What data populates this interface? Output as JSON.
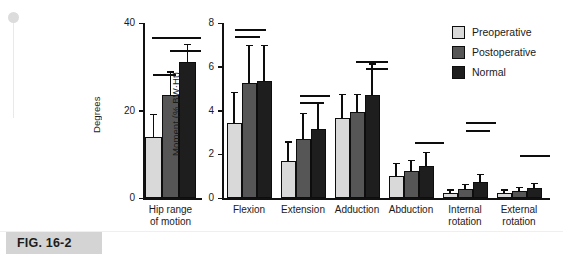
{
  "figure": {
    "caption_tag": "FIG. 16-2"
  },
  "legend": {
    "items": [
      {
        "label": "Preoperative",
        "color": "#d9d9d9"
      },
      {
        "label": "Postoperative",
        "color": "#565656"
      },
      {
        "label": "Normal",
        "color": "#1e1e1e"
      }
    ]
  },
  "chart_data": [
    {
      "type": "bar",
      "title": "",
      "panel": "left",
      "xlabel": "",
      "ylabel": "Degrees",
      "ylim": [
        0,
        40
      ],
      "yticks": [
        0,
        20,
        40
      ],
      "ytick_labels": [
        "0",
        "20",
        "40"
      ],
      "grid": false,
      "categories": [
        "Hip range\nof motion"
      ],
      "series": [
        {
          "name": "Preoperative",
          "values": [
            14.0
          ],
          "errors": [
            5.2
          ]
        },
        {
          "name": "Postoperative",
          "values": [
            23.5
          ],
          "errors": [
            5.5
          ]
        },
        {
          "name": "Normal",
          "values": [
            31.0
          ],
          "errors": [
            4.3
          ]
        }
      ],
      "significance_bars": [
        {
          "note": "Preoperative vs Normal",
          "span": "wide",
          "level": 1
        },
        {
          "note": "Postoperative vs Normal",
          "span": "narrow",
          "level": 2
        },
        {
          "note": "Preoperative vs Postoperative",
          "span": "short",
          "level": 3
        }
      ]
    },
    {
      "type": "bar",
      "title": "",
      "panel": "right",
      "xlabel": "",
      "ylabel": "Moment (% BW·Ht)",
      "ylim": [
        0,
        8
      ],
      "yticks": [
        0,
        2,
        4,
        6,
        8
      ],
      "ytick_labels": [
        "0",
        "2",
        "4",
        "6",
        "8"
      ],
      "grid": false,
      "categories": [
        "Flexion",
        "Extension",
        "Adduction",
        "Abduction",
        "Internal\nrotation",
        "External\nrotation"
      ],
      "series": [
        {
          "name": "Preoperative",
          "values": [
            3.45,
            1.7,
            3.65,
            1.0,
            0.25,
            0.22
          ],
          "errors": [
            1.4,
            0.9,
            1.1,
            0.6,
            0.15,
            0.18
          ]
        },
        {
          "name": "Postoperative",
          "values": [
            5.25,
            2.7,
            3.95,
            1.25,
            0.4,
            0.3
          ],
          "errors": [
            1.75,
            1.2,
            0.8,
            0.5,
            0.25,
            0.22
          ]
        },
        {
          "name": "Normal",
          "values": [
            5.35,
            3.15,
            4.7,
            1.45,
            0.75,
            0.45
          ],
          "errors": [
            1.65,
            1.25,
            1.45,
            0.65,
            0.35,
            0.25
          ]
        }
      ],
      "significance_bars": [
        {
          "group": "Flexion",
          "count": 2
        },
        {
          "group": "Extension",
          "count": 2
        },
        {
          "group": "Adduction",
          "count": 2
        },
        {
          "group": "Abduction",
          "count": 1
        },
        {
          "group": "Internal rotation",
          "count": 2
        },
        {
          "group": "External rotation",
          "count": 1
        }
      ]
    }
  ]
}
